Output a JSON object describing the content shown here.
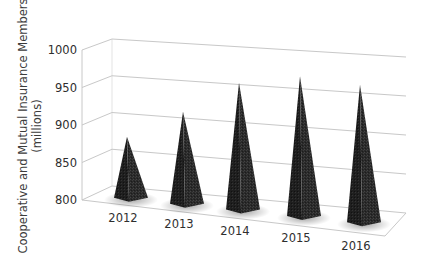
{
  "chart_data": {
    "type": "bar",
    "subtype": "3d-pyramid",
    "title": "",
    "xlabel": "",
    "ylabel": "Cooperative and Mutual Insurance Members (millions)",
    "ylabel_lines": [
      "Cooperative and Mutual Insurance Members",
      "(millions)"
    ],
    "categories": [
      "2012",
      "2013",
      "2014",
      "2015",
      "2016"
    ],
    "values": [
      875,
      915,
      960,
      975,
      970
    ],
    "ylim": [
      800,
      1000
    ],
    "yticks": [
      "800",
      "850",
      "900",
      "950",
      "1000"
    ],
    "grid": true,
    "legend": "none",
    "bar_color": "#2b2b2b"
  }
}
